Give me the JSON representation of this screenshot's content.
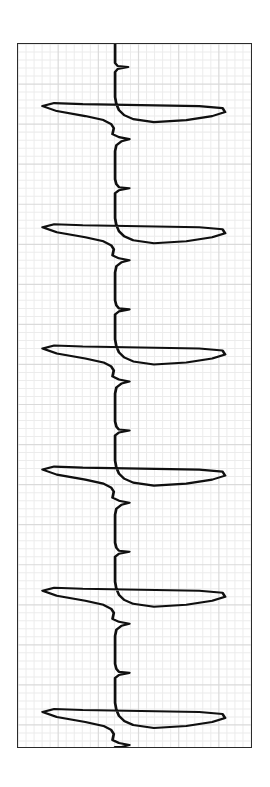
{
  "page": {
    "background_color": "#ffffff",
    "width": 270,
    "height": 787
  },
  "strip": {
    "name": "ecg-rhythm-strip",
    "orientation": "rotated-90-clockwise",
    "frame_color": "#2b2b2b",
    "paper_color": "#ffffff",
    "trace_color": "#101010",
    "grid": {
      "minor_color": "#ececec",
      "major_color": "#dadada",
      "minor_spacing_px": 8,
      "major_every": 5,
      "minor_cols": 29,
      "minor_rows": 88
    },
    "frame": {
      "left": 17,
      "top": 43,
      "width": 235,
      "height": 705
    }
  },
  "chart_data": {
    "type": "line",
    "title": "",
    "subtitle": "",
    "xlabel": "",
    "ylabel": "",
    "legend": [],
    "grid": true,
    "signal": {
      "lead": "",
      "baseline_px_x": 92,
      "time_axis": "vertical",
      "amplitude_axis": "horizontal",
      "beats": 5,
      "beat_time_px": [
        118,
        272,
        400,
        540,
        678
      ],
      "beat_interval_px": 140,
      "r_wave_tip_px_x": 36,
      "s_wave_tip_px_x": 131,
      "complexes": [
        {
          "index": 0,
          "p_wave_px": [
            38,
            40
          ],
          "q_notch_px_x": 99,
          "r_peak_px": [
            118,
            36
          ],
          "s_peak_px": [
            104,
            131
          ],
          "t_wave_px": [
            166,
            99
          ],
          "label": "complex-1"
        },
        {
          "index": 1,
          "p_wave_px": [
            194,
            40
          ],
          "q_notch_px_x": 99,
          "r_peak_px": [
            272,
            36
          ],
          "s_peak_px": [
            258,
            131
          ],
          "t_wave_px": [
            327,
            99
          ],
          "label": "complex-2"
        },
        {
          "index": 2,
          "p_wave_px": [
            322,
            40
          ],
          "q_notch_px_x": 99,
          "r_peak_px": [
            400,
            36
          ],
          "s_peak_px": [
            387,
            131
          ],
          "t_wave_px": [
            466,
            104
          ],
          "label": "complex-3"
        },
        {
          "index": 3,
          "p_wave_px": [
            462,
            40
          ],
          "q_notch_px_x": 99,
          "r_peak_px": [
            540,
            36
          ],
          "s_peak_px": [
            527,
            131
          ],
          "t_wave_px": [
            604,
            99
          ],
          "label": "complex-4"
        },
        {
          "index": 4,
          "p_wave_px": [
            600,
            40
          ],
          "q_notch_px_x": 99,
          "r_peak_px": [
            678,
            36
          ],
          "s_peak_px": [
            665,
            131
          ],
          "t_wave_px": [
            740,
            99
          ],
          "label": "complex-5"
        }
      ],
      "path": "M 75,0 L 75,19 L 77,22 L 85,23 L 77,25 L 75,28 L 75,53 L 76,60 L 78,66 L 82,71 L 89,75 L 105,78 L 130,76 L 150,72 L 160,68 L 158,64 L 140,62 L 95,61 L 50,60 L 28,59 L 19,62 L 30,67 L 52,72 L 66,76 L 72,80 L 74,84 L 73,90 L 78,93 L 86,95 L 80,97 L 76,101 L 75,107 L 75,135 L 76,140 L 78,143 L 86,144 L 78,146 L 75,149 L 75,174 L 76,181 L 78,187 L 82,192 L 89,196 L 105,199 L 130,197 L 150,193 L 160,189 L 158,185 L 140,183 L 95,182 L 50,181 L 28,180 L 19,183 L 30,188 L 52,193 L 66,197 L 72,201 L 74,205 L 73,211 L 78,214 L 86,216 L 80,218 L 76,222 L 75,228 L 75,256 L 76,261 L 78,264 L 86,265 L 78,267 L 75,270 L 75,295 L 76,302 L 78,308 L 82,313 L 89,317 L 105,320 L 130,318 L 150,314 L 160,310 L 158,306 L 140,304 L 95,303 L 50,302 L 28,301 L 19,304 L 30,309 L 52,314 L 66,318 L 72,322 L 74,326 L 73,332 L 78,335 L 86,337 L 80,339 L 76,343 L 75,349 L 75,377 L 76,382 L 78,385 L 86,386 L 78,388 L 75,391 L 75,416 L 76,423 L 78,429 L 82,434 L 89,438 L 105,441 L 130,439 L 150,435 L 160,431 L 158,427 L 140,425 L 95,424 L 50,423 L 28,422 L 19,425 L 30,430 L 52,435 L 66,439 L 72,443 L 74,447 L 73,453 L 78,456 L 86,458 L 80,460 L 76,464 L 75,470 L 75,498 L 76,503 L 78,506 L 86,507 L 78,509 L 75,512 L 75,537 L 76,544 L 78,550 L 82,555 L 89,559 L 105,562 L 130,560 L 150,556 L 160,552 L 158,548 L 140,546 L 95,545 L 50,544 L 28,543 L 19,546 L 30,551 L 52,556 L 66,560 L 72,564 L 74,568 L 73,574 L 78,577 L 86,579 L 80,581 L 76,585 L 75,591 L 75,619 L 76,624 L 78,627 L 86,628 L 78,630 L 75,633 L 75,658 L 76,665 L 78,671 L 82,676 L 89,680 L 105,683 L 130,681 L 150,677 L 160,673 L 158,669 L 140,667 L 95,666 L 50,665 L 28,664 L 19,667 L 30,672 L 52,677 L 66,681 L 72,685 L 74,689 L 73,695 L 78,698 L 86,700 L 80,702 L 76,702 L 75,702"
    }
  }
}
